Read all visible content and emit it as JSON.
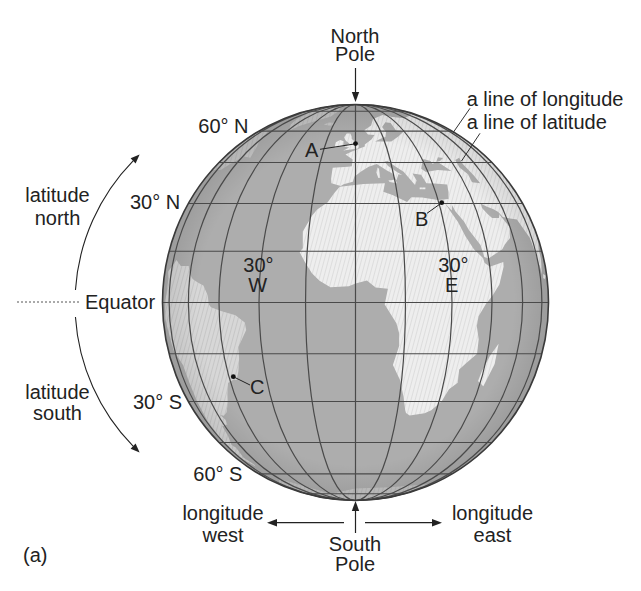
{
  "figure": {
    "panel_label": "(a)",
    "north_pole": {
      "line1": "North",
      "line2": "Pole"
    },
    "south_pole": {
      "line1": "South",
      "line2": "Pole"
    },
    "callouts": {
      "longitude_line": "a line of longitude",
      "latitude_line": "a line of latitude"
    },
    "latitude_labels": {
      "lat_60n": "60° N",
      "lat_30n": "30° N",
      "equator": "Equator",
      "lat_30s": "30° S",
      "lat_60s": "60° S"
    },
    "longitude_labels": {
      "lon_30w": {
        "degrees": "30°",
        "direction": "W"
      },
      "lon_30e": {
        "degrees": "30°",
        "direction": "E"
      }
    },
    "direction_arrows": {
      "latitude_north": {
        "line1": "latitude",
        "line2": "north"
      },
      "latitude_south": {
        "line1": "latitude",
        "line2": "south"
      },
      "longitude_west": {
        "line1": "longitude",
        "line2": "west"
      },
      "longitude_east": {
        "line1": "longitude",
        "line2": "east"
      }
    },
    "points": [
      {
        "label": "A"
      },
      {
        "label": "B"
      },
      {
        "label": "C"
      }
    ]
  },
  "colors": {
    "ocean": "#adadad",
    "land": "#eeeeee",
    "grid": "#4a4a4a",
    "text": "#222222",
    "background": "#ffffff"
  }
}
